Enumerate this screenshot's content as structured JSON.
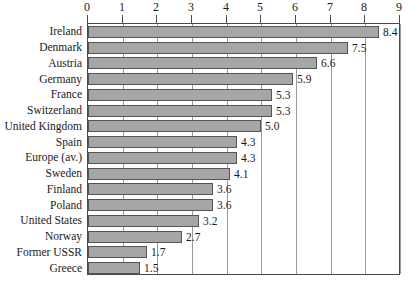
{
  "chart_data": {
    "type": "bar",
    "orientation": "horizontal",
    "title": "",
    "xlabel": "",
    "ylabel": "",
    "xlim": [
      0,
      9
    ],
    "xticks": [
      "0",
      "1",
      "2",
      "3",
      "4",
      "5",
      "6",
      "7",
      "8",
      "9"
    ],
    "grid": true,
    "legend": "none",
    "bar_color": "#a6a6a6",
    "bar_border_color": "#555555",
    "axis_color": "#4a4a4a",
    "gridline_color": "#9a9a9a",
    "categories": [
      "Ireland",
      "Denmark",
      "Austria",
      "Germany",
      "France",
      "Switzerland",
      "United Kingdom",
      "Spain",
      "Europe (av.)",
      "Sweden",
      "Finland",
      "Poland",
      "United States",
      "Norway",
      "Former USSR",
      "Greece"
    ],
    "values": [
      8.4,
      7.5,
      6.6,
      5.9,
      5.3,
      5.3,
      5.0,
      4.3,
      4.3,
      4.1,
      3.6,
      3.6,
      3.2,
      2.7,
      1.7,
      1.5
    ],
    "value_labels": [
      "8.4",
      "7.5",
      "6.6",
      "5.9",
      "5.3",
      "5.3",
      "5.0",
      "4.3",
      "4.3",
      "4.1",
      "3.6",
      "3.6",
      "3.2",
      "2.7",
      "1.7",
      "1.5"
    ]
  }
}
